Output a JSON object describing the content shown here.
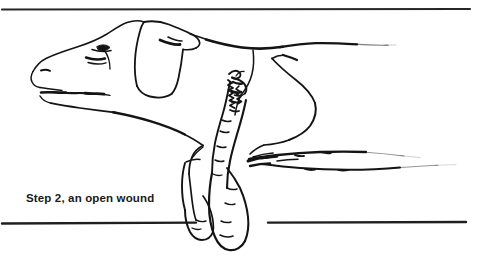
{
  "figure": {
    "title": "Step 2, an open wound",
    "caption": "Step 2, an open wound",
    "style": "black-and-white pen line illustration",
    "background_color": "#ffffff",
    "ink_color": "#141414",
    "rules": {
      "top_rule_label": "top horizontal rule",
      "bottom_rule_label": "bottom horizontal rule"
    },
    "parts": [
      {
        "name": "head",
        "label": "dog head"
      },
      {
        "name": "muzzle",
        "label": "muzzle and mouth"
      },
      {
        "name": "eye",
        "label": "eye"
      },
      {
        "name": "nostril",
        "label": "nostril"
      },
      {
        "name": "ear",
        "label": "floppy ear"
      },
      {
        "name": "neck",
        "label": "neck and chest"
      },
      {
        "name": "back",
        "label": "back line"
      },
      {
        "name": "haunch",
        "label": "hind quarter"
      },
      {
        "name": "foreleg-front",
        "label": "front foreleg"
      },
      {
        "name": "foreleg-rear",
        "label": "rear foreleg"
      },
      {
        "name": "paw-front",
        "label": "front paw"
      },
      {
        "name": "paw-rear",
        "label": "rear paw"
      },
      {
        "name": "wound",
        "label": "open wound on foreleg"
      },
      {
        "name": "hind-legs",
        "label": "outstretched hind legs"
      }
    ]
  }
}
